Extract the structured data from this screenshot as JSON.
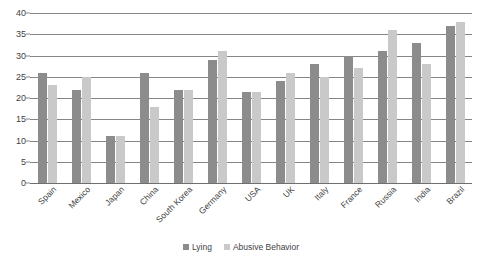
{
  "chart_data": {
    "type": "bar",
    "title": "",
    "xlabel": "",
    "ylabel": "",
    "ylim": [
      0,
      40
    ],
    "yticks": [
      0,
      5,
      10,
      15,
      20,
      25,
      30,
      35,
      40
    ],
    "grid": true,
    "legend_position": "bottom",
    "categories": [
      "Spain",
      "Mexico",
      "Japan",
      "China",
      "South Korea",
      "Germany",
      "USA",
      "UK",
      "Italy",
      "France",
      "Russia",
      "India",
      "Brazil"
    ],
    "series": [
      {
        "name": "Lying",
        "color": "#8c8c8c",
        "values": [
          26,
          22,
          11,
          26,
          22,
          29,
          21.5,
          24,
          28,
          30,
          31,
          33,
          37
        ]
      },
      {
        "name": "Abusive Behavior",
        "color": "#c9c9c9",
        "values": [
          23,
          25,
          11,
          18,
          22,
          31,
          21.5,
          26,
          25,
          27,
          36,
          28,
          38
        ]
      }
    ]
  },
  "axis": {
    "y_tick_labels": [
      "0",
      "5",
      "10",
      "15",
      "20",
      "25",
      "30",
      "35",
      "40"
    ]
  },
  "legend": {
    "items": [
      {
        "label": "Lying"
      },
      {
        "label": "Abusive Behavior"
      }
    ]
  },
  "colors": {
    "series_lying": "#8c8c8c",
    "series_abusive": "#c9c9c9",
    "gridline": "#868686",
    "text": "#3f3f3f",
    "background": "#ffffff"
  }
}
